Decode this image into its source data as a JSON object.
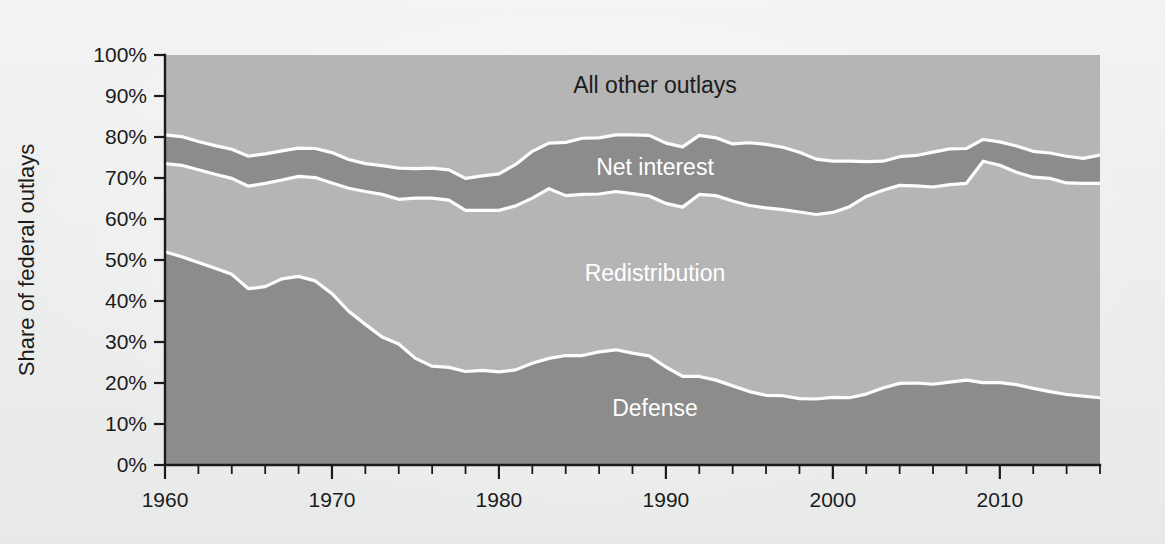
{
  "figure": {
    "background_color": "#eef0ef",
    "plot_background_color": "#b5b5b5"
  },
  "chart_data": {
    "type": "area",
    "title": "",
    "subtitle": "",
    "xlabel": "",
    "ylabel": "Share of federal outlays",
    "stacked": true,
    "normalized_to_100": true,
    "grid": false,
    "legend_position": "inline-labels",
    "xlim": [
      1960,
      2016
    ],
    "ylim": [
      0,
      100
    ],
    "x_tick_labels": [
      "1960",
      "1970",
      "1980",
      "1990",
      "2000",
      "2010"
    ],
    "x_tick_values": [
      1960,
      1970,
      1980,
      1990,
      2000,
      2010
    ],
    "x_minor_tick_step": 2,
    "y_tick_labels": [
      "0%",
      "10%",
      "20%",
      "30%",
      "40%",
      "50%",
      "60%",
      "70%",
      "80%",
      "90%",
      "100%"
    ],
    "y_tick_values": [
      0,
      10,
      20,
      30,
      40,
      50,
      60,
      70,
      80,
      90,
      100
    ],
    "colors": {
      "defense": "#8c8c8c",
      "redistribution": "#b5b5b5",
      "net_interest": "#8c8c8c",
      "all_other_outlays": "#b5b5b5",
      "separator": "#fdfdfd",
      "axis": "#1b1b1b"
    },
    "x": [
      1960,
      1961,
      1962,
      1963,
      1964,
      1965,
      1966,
      1967,
      1968,
      1969,
      1970,
      1971,
      1972,
      1973,
      1974,
      1975,
      1976,
      1977,
      1978,
      1979,
      1980,
      1981,
      1982,
      1983,
      1984,
      1985,
      1986,
      1987,
      1988,
      1989,
      1990,
      1991,
      1992,
      1993,
      1994,
      1995,
      1996,
      1997,
      1998,
      1999,
      2000,
      2001,
      2002,
      2003,
      2004,
      2005,
      2006,
      2007,
      2008,
      2009,
      2010,
      2011,
      2012,
      2013,
      2014,
      2015,
      2016
    ],
    "series": [
      {
        "name": "Defense",
        "label": "Defense",
        "label_color": "#ffffff",
        "color": "#8c8c8c",
        "stack_order": 1,
        "values": [
          52.0,
          50.8,
          49.4,
          48.0,
          46.5,
          43.0,
          43.5,
          45.4,
          46.0,
          44.9,
          41.8,
          37.5,
          34.3,
          31.2,
          29.5,
          26.0,
          24.1,
          23.8,
          22.8,
          23.1,
          22.7,
          23.2,
          24.8,
          26.0,
          26.7,
          26.7,
          27.6,
          28.1,
          27.3,
          26.6,
          23.9,
          21.6,
          21.6,
          20.7,
          19.3,
          17.9,
          17.0,
          16.9,
          16.2,
          16.1,
          16.5,
          16.4,
          17.3,
          18.8,
          19.9,
          20.0,
          19.7,
          20.2,
          20.7,
          20.1,
          20.1,
          19.6,
          18.7,
          17.9,
          17.2,
          16.8,
          16.4
        ]
      },
      {
        "name": "Redistribution",
        "label": "Redistribution",
        "label_color": "#ffffff",
        "color": "#b5b5b5",
        "stack_order": 2,
        "values": [
          21.5,
          22.3,
          22.6,
          22.9,
          23.4,
          25.0,
          25.2,
          24.1,
          24.4,
          25.2,
          27.0,
          30.0,
          32.4,
          34.8,
          35.3,
          39.1,
          41.0,
          40.8,
          39.3,
          39.0,
          39.4,
          40.0,
          40.3,
          41.4,
          39.0,
          39.3,
          38.5,
          38.6,
          38.9,
          39.0,
          39.9,
          41.3,
          44.4,
          45.0,
          45.1,
          45.4,
          45.7,
          45.4,
          45.5,
          45.0,
          45.1,
          46.6,
          48.2,
          48.2,
          48.3,
          48.1,
          48.1,
          48.2,
          48.0,
          54.0,
          53.0,
          51.8,
          51.5,
          52.0,
          51.6,
          51.9,
          52.3
        ]
      },
      {
        "name": "Net interest",
        "label": "Net interest",
        "label_color": "#ffffff",
        "color": "#8c8c8c",
        "stack_order": 3,
        "values": [
          7.0,
          7.0,
          6.9,
          7.0,
          7.1,
          7.3,
          7.2,
          7.1,
          6.9,
          7.1,
          7.4,
          7.0,
          6.8,
          7.0,
          7.6,
          7.2,
          7.3,
          7.4,
          7.8,
          8.4,
          8.9,
          10.1,
          11.4,
          11.1,
          13.0,
          13.7,
          13.7,
          13.8,
          14.3,
          14.8,
          14.7,
          14.7,
          14.4,
          14.1,
          13.9,
          15.3,
          15.5,
          15.2,
          14.6,
          13.5,
          12.5,
          11.1,
          8.5,
          7.1,
          7.0,
          7.4,
          8.5,
          8.7,
          8.5,
          5.3,
          5.7,
          6.4,
          6.3,
          6.2,
          6.5,
          6.1,
          6.9
        ]
      },
      {
        "name": "All other outlays",
        "label": "All other outlays",
        "label_color": "#1c1c1c",
        "color": "#b5b5b5",
        "stack_order": 4,
        "values": [
          19.5,
          19.9,
          21.1,
          22.1,
          23.0,
          24.7,
          24.1,
          23.4,
          22.7,
          22.8,
          23.8,
          25.5,
          26.5,
          27.0,
          27.6,
          27.7,
          27.6,
          28.0,
          30.1,
          29.5,
          29.0,
          26.7,
          23.5,
          21.5,
          21.3,
          20.3,
          20.2,
          19.5,
          19.5,
          19.6,
          21.5,
          22.4,
          19.6,
          20.2,
          21.7,
          21.4,
          21.8,
          22.5,
          23.7,
          25.4,
          25.9,
          25.9,
          26.0,
          25.9,
          24.8,
          24.5,
          23.7,
          22.9,
          22.8,
          20.6,
          21.2,
          22.2,
          23.5,
          23.9,
          24.7,
          25.2,
          24.4
        ]
      }
    ],
    "cumulative_tops": {
      "note": "cumulative stacked upper boundaries in percent",
      "defense_top": [
        52.0,
        50.8,
        49.4,
        48.0,
        46.5,
        43.0,
        43.5,
        45.4,
        46.0,
        44.9,
        41.8,
        37.5,
        34.3,
        31.2,
        29.5,
        26.0,
        24.1,
        23.8,
        22.8,
        23.1,
        22.7,
        23.2,
        24.8,
        26.0,
        26.7,
        26.7,
        27.6,
        28.1,
        27.3,
        26.6,
        23.9,
        21.6,
        21.6,
        20.7,
        19.3,
        17.9,
        17.0,
        16.9,
        16.2,
        16.1,
        16.5,
        16.4,
        17.3,
        18.8,
        19.9,
        20.0,
        19.7,
        20.2,
        20.7,
        20.1,
        20.1,
        19.6,
        18.7,
        17.9,
        17.2,
        16.8,
        16.4
      ],
      "redistribution_top": [
        73.5,
        73.1,
        72.0,
        70.9,
        69.9,
        68.0,
        68.7,
        69.5,
        70.4,
        70.1,
        68.8,
        67.5,
        66.7,
        66.0,
        64.8,
        65.1,
        65.1,
        64.6,
        62.1,
        62.1,
        62.1,
        63.2,
        65.1,
        67.4,
        65.7,
        66.0,
        66.1,
        66.7,
        66.2,
        65.6,
        63.8,
        62.9,
        66.0,
        65.7,
        64.4,
        63.3,
        62.7,
        62.3,
        61.7,
        61.1,
        61.6,
        63.0,
        65.5,
        67.0,
        68.2,
        68.1,
        67.8,
        68.4,
        68.7,
        74.1,
        73.1,
        71.4,
        70.2,
        69.9,
        68.8,
        68.7,
        68.7
      ],
      "net_interest_top": [
        80.5,
        80.1,
        78.9,
        77.9,
        77.0,
        75.3,
        75.9,
        76.6,
        77.3,
        77.2,
        76.2,
        74.5,
        73.5,
        73.0,
        72.4,
        72.3,
        72.4,
        72.0,
        69.9,
        70.5,
        71.0,
        73.3,
        76.5,
        78.5,
        78.7,
        79.7,
        79.8,
        80.5,
        80.5,
        80.4,
        78.5,
        77.6,
        80.4,
        79.8,
        78.3,
        78.6,
        78.2,
        77.5,
        76.3,
        74.6,
        74.1,
        74.1,
        74.0,
        74.1,
        75.2,
        75.5,
        76.3,
        77.1,
        77.2,
        79.4,
        78.8,
        77.8,
        76.5,
        76.1,
        75.3,
        74.8,
        75.6
      ]
    }
  }
}
